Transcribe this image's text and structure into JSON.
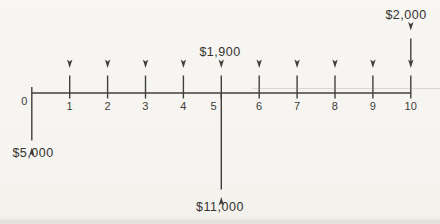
{
  "figure": {
    "type": "cash-flow-diagram",
    "timeline": {
      "tick_labels": [
        "0",
        "1",
        "2",
        "3",
        "4",
        "5",
        "6",
        "7",
        "8",
        "9",
        "10"
      ]
    },
    "flows": {
      "down_at_0": {
        "amount": "$5,000",
        "period": 0,
        "direction": "down"
      },
      "up_series": {
        "amount": "$1,900",
        "periods": [
          1,
          2,
          3,
          4,
          5,
          6,
          7,
          8,
          9,
          10
        ],
        "direction": "up",
        "label_shown_at_period": 5
      },
      "down_at_5": {
        "amount": "$11,000",
        "period": 5,
        "direction": "down"
      },
      "up_at_10": {
        "amount": "$2,000",
        "period": 10,
        "direction": "up"
      }
    },
    "colors": {
      "ink": "#413f3c",
      "paper": "#f5f4f0"
    }
  }
}
